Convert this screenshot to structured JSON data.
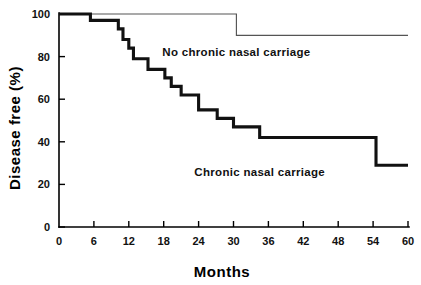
{
  "chart_data": {
    "type": "line",
    "title": "",
    "xlabel": "Months",
    "ylabel": "Disease free (%)",
    "xlim": [
      0,
      60
    ],
    "ylim": [
      0,
      100
    ],
    "grid": false,
    "legend_position": "inline-annotation",
    "x_ticks": [
      0,
      6,
      12,
      18,
      24,
      30,
      36,
      42,
      48,
      54,
      60
    ],
    "x_tick_labels": [
      "0",
      "6",
      "12",
      "18",
      "24",
      "30",
      "36",
      "42",
      "48",
      "54",
      "60"
    ],
    "y_ticks": [
      0,
      20,
      40,
      60,
      80,
      100
    ],
    "y_tick_labels": [
      "0",
      "20",
      "40",
      "60",
      "80",
      "100"
    ],
    "series": [
      {
        "name": "No chronic nasal carriage",
        "style": "thin",
        "label_x": 30.5,
        "label_y": 82,
        "steps": [
          {
            "month": 0,
            "percent": 100
          },
          {
            "month": 30.5,
            "percent": 100
          },
          {
            "month": 30.5,
            "percent": 90
          },
          {
            "month": 60,
            "percent": 90
          }
        ]
      },
      {
        "name": "Chronic nasal carriage",
        "style": "thick",
        "label_x": 34.5,
        "label_y": 26,
        "steps": [
          {
            "month": 0,
            "percent": 100
          },
          {
            "month": 5.4,
            "percent": 100
          },
          {
            "month": 5.4,
            "percent": 97
          },
          {
            "month": 10.2,
            "percent": 97
          },
          {
            "month": 10.2,
            "percent": 93
          },
          {
            "month": 11.0,
            "percent": 93
          },
          {
            "month": 11.0,
            "percent": 88
          },
          {
            "month": 12.0,
            "percent": 88
          },
          {
            "month": 12.0,
            "percent": 84
          },
          {
            "month": 12.8,
            "percent": 84
          },
          {
            "month": 12.8,
            "percent": 79
          },
          {
            "month": 15.3,
            "percent": 79
          },
          {
            "month": 15.3,
            "percent": 74
          },
          {
            "month": 18.2,
            "percent": 74
          },
          {
            "month": 18.2,
            "percent": 70
          },
          {
            "month": 19.3,
            "percent": 70
          },
          {
            "month": 19.3,
            "percent": 66
          },
          {
            "month": 21.0,
            "percent": 66
          },
          {
            "month": 21.0,
            "percent": 62
          },
          {
            "month": 24.0,
            "percent": 62
          },
          {
            "month": 24.0,
            "percent": 55
          },
          {
            "month": 27.2,
            "percent": 55
          },
          {
            "month": 27.2,
            "percent": 51
          },
          {
            "month": 30.0,
            "percent": 51
          },
          {
            "month": 30.0,
            "percent": 47
          },
          {
            "month": 34.5,
            "percent": 47
          },
          {
            "month": 34.5,
            "percent": 42
          },
          {
            "month": 54.5,
            "percent": 42
          },
          {
            "month": 54.5,
            "percent": 29
          },
          {
            "month": 60,
            "percent": 29
          }
        ]
      }
    ]
  },
  "axis": {
    "y_title": "Disease free (%)",
    "x_title": "Months"
  },
  "annotations": {
    "upper_curve_label": "No chronic nasal carriage",
    "lower_curve_label": "Chronic nasal carriage"
  }
}
